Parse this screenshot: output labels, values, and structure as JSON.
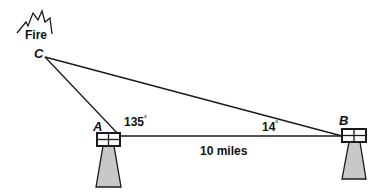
{
  "diagram": {
    "type": "triangle-word-problem",
    "fire_label": "Fire",
    "points": {
      "A": {
        "label": "A",
        "x": 120,
        "y": 136
      },
      "B": {
        "label": "B",
        "x": 342,
        "y": 136
      },
      "C": {
        "label": "C",
        "x": 45,
        "y": 57
      }
    },
    "angles": {
      "A": {
        "value": "135",
        "unit": "°"
      },
      "B": {
        "value": "14",
        "unit": "°"
      }
    },
    "side_AB": {
      "label": "10 miles"
    },
    "colors": {
      "line": "#1a1a1a",
      "tower_fill": "#c8c8c8",
      "box_fill": "#ffffff"
    }
  }
}
